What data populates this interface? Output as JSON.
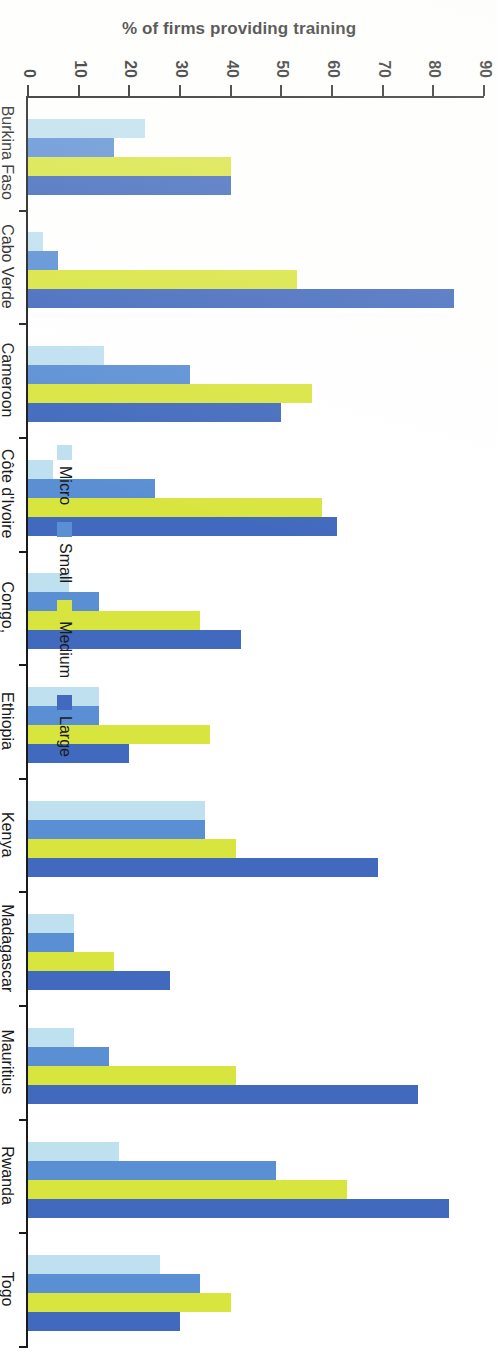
{
  "chart_data": {
    "type": "bar",
    "orientation": "vertical",
    "title": "",
    "xlabel": "",
    "ylabel": "% of firms providing training",
    "ylim": [
      0,
      90
    ],
    "ytick_labels": [
      "0",
      "10",
      "20",
      "30",
      "40",
      "50",
      "60",
      "70",
      "80",
      "90"
    ],
    "ytick_values": [
      0,
      10,
      20,
      30,
      40,
      50,
      60,
      70,
      80,
      90
    ],
    "grid": false,
    "legend_position": "bottom",
    "categories": [
      "Burkina Faso",
      "Cabo Verde",
      "Cameroon",
      "Côte d'Ivoire",
      "Congo,\nDem. Rep.",
      "Ethiopia",
      "Kenya",
      "Madagascar",
      "Mauritius",
      "Rwanda",
      "Togo"
    ],
    "series": [
      {
        "name": "Micro",
        "color": "#bfe0ef",
        "values": [
          23,
          3,
          15,
          5,
          8,
          14,
          35,
          9,
          9,
          18,
          26
        ]
      },
      {
        "name": "Small",
        "color": "#5b8fd4",
        "values": [
          17,
          6,
          32,
          25,
          14,
          14,
          35,
          9,
          16,
          49,
          34
        ]
      },
      {
        "name": "Medium",
        "color": "#d9e53f",
        "values": [
          40,
          53,
          56,
          58,
          34,
          36,
          41,
          17,
          41,
          63,
          40
        ]
      },
      {
        "name": "Large",
        "color": "#4169bd",
        "values": [
          40,
          84,
          50,
          61,
          42,
          20,
          69,
          28,
          77,
          83,
          30
        ]
      }
    ]
  },
  "legend": {
    "items": [
      {
        "label": "Micro",
        "color": "#bfe0ef"
      },
      {
        "label": "Small",
        "color": "#5b8fd4"
      },
      {
        "label": "Medium",
        "color": "#d9e53f"
      },
      {
        "label": "Large",
        "color": "#4169bd"
      }
    ]
  },
  "axis": {
    "value_axis_title": "% of firms providing training"
  }
}
